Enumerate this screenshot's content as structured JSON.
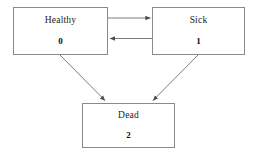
{
  "diagram": {
    "background_color": "#ffffff",
    "border_color": "#8a8a8a",
    "edge_color": "#6e6e6e",
    "text_color": "#1a1a1a",
    "nodes": [
      {
        "id": "healthy",
        "label": "Healthy",
        "index": "0"
      },
      {
        "id": "sick",
        "label": "Sick",
        "index": "1"
      },
      {
        "id": "dead",
        "label": "Dead",
        "index": "2"
      }
    ],
    "edges": [
      {
        "id": "healthy-to-sick",
        "from": "Healthy",
        "to": "Sick",
        "label": ""
      },
      {
        "id": "sick-to-healthy",
        "from": "Sick",
        "to": "Healthy",
        "label": ""
      },
      {
        "id": "healthy-to-dead",
        "from": "Healthy",
        "to": "Dead",
        "label": ""
      },
      {
        "id": "sick-to-dead",
        "from": "Sick",
        "to": "Dead",
        "label": ""
      }
    ]
  }
}
